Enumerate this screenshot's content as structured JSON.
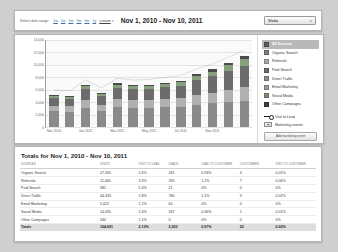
{
  "header": {
    "range_label": "Select date range:",
    "ranges": [
      "1w",
      "2w",
      "1m",
      "3m",
      "6m",
      "1y",
      "custom"
    ],
    "custom_caret": "▾",
    "date_title": "Nov 1, 2010 - Nov 10, 2011",
    "metric_selected": "Visits",
    "metric_caret": "▾"
  },
  "legend": {
    "items": [
      {
        "label": "All Sources",
        "color": "#5b5b5b",
        "selected": true
      },
      {
        "label": "Organic Search",
        "color": "#7d7d7d",
        "selected": false
      },
      {
        "label": "Referrals",
        "color": "#a8a8a8",
        "selected": false
      },
      {
        "label": "Paid Search",
        "color": "#6e6e6e",
        "selected": false
      },
      {
        "label": "Direct Traffic",
        "color": "#8d8d8d",
        "selected": false
      },
      {
        "label": "Email Marketing",
        "color": "#9a9a9a",
        "selected": false
      },
      {
        "label": "Social Media",
        "color": "#7a8f72",
        "selected": false
      },
      {
        "label": "Other Campaigns",
        "color": "#3f3f3f",
        "selected": false
      }
    ],
    "visit_to_lead": "Visit to Lead",
    "marketing_events": "Marketing events",
    "add_button": "Add marketing event"
  },
  "chart_data": {
    "type": "bar",
    "stacked": true,
    "title": "",
    "xlabel": "",
    "ylabel": "",
    "ylim": [
      0,
      14000
    ],
    "yticks": [
      "0",
      "2,000",
      "4,000",
      "6,000",
      "8,000",
      "10,000",
      "12,000",
      "14,000"
    ],
    "ytick_values": [
      0,
      2000,
      4000,
      6000,
      8000,
      10000,
      12000,
      14000
    ],
    "grid": true,
    "legend_position": "right",
    "categories": [
      "Nov 2010",
      "Dec 2010",
      "Jan 2011",
      "Feb 2011",
      "Mar 2011",
      "Apr 2011",
      "May 2011",
      "Jun 2011",
      "Jul 2011",
      "Aug 2011",
      "Sep 2011",
      "Oct 2011",
      "Nov 2011"
    ],
    "tick_labels": [
      "Nov 2010",
      "Jan 2011",
      "Mar 2011",
      "May 2011",
      "Jul 2011",
      "Sep 2011"
    ],
    "tick_index": [
      0,
      2,
      4,
      6,
      8,
      10
    ],
    "series": [
      {
        "name": "Organic Search",
        "color": "#8a8a8a",
        "values": [
          2500,
          2450,
          3050,
          2600,
          3150,
          3100,
          3050,
          3150,
          3250,
          3550,
          3800,
          4050,
          4250
        ]
      },
      {
        "name": "Referrals",
        "color": "#b0b0b0",
        "values": [
          950,
          900,
          1250,
          1000,
          1300,
          1250,
          1300,
          1350,
          1400,
          1650,
          1750,
          1950,
          2150
        ]
      },
      {
        "name": "Direct Traffic",
        "color": "#6c6c6c",
        "values": [
          1250,
          1200,
          1800,
          1350,
          1900,
          1750,
          1800,
          1900,
          2000,
          2350,
          2600,
          3000,
          3450
        ]
      },
      {
        "name": "Social Media",
        "color": "#86a07c",
        "values": [
          300,
          320,
          420,
          360,
          450,
          430,
          460,
          500,
          540,
          640,
          760,
          900,
          1050
        ]
      },
      {
        "name": "Other Campaigns",
        "color": "#4a4a4a",
        "values": [
          120,
          130,
          190,
          150,
          200,
          190,
          210,
          230,
          250,
          310,
          380,
          470,
          600
        ]
      }
    ],
    "totals": [
      5120,
      5000,
      6710,
      5460,
      7000,
      6720,
      6820,
      7130,
      7440,
      8500,
      9290,
      10370,
      11500
    ],
    "trend_line": {
      "name": "Visit to Lead",
      "color": "#1b1b1b"
    }
  },
  "totals": {
    "title": "Totals for Nov 1, 2010 - Nov 10, 2011",
    "columns": [
      "Sources",
      "Visits",
      "Visit to Lead",
      "Leads",
      "Lead to Customer",
      "Customers",
      "Visit to Customer"
    ],
    "rows": [
      {
        "source": "Organic Search",
        "visits": "27,565",
        "visit_to_lead": "1.6%",
        "leads": "431",
        "lead_to_customer": "0.93%",
        "customers": "4",
        "visit_to_customer": "0.01%"
      },
      {
        "source": "Referrals",
        "visits": "11,460",
        "visit_to_lead": "3.3%",
        "leads": "335",
        "lead_to_customer": "1.2%",
        "customers": "7",
        "visit_to_customer": "0.06%"
      },
      {
        "source": "Paid Search",
        "visits": "382",
        "visit_to_lead": "5.4%",
        "leads": "21",
        "lead_to_customer": "0%",
        "customers": "0",
        "visit_to_customer": "0%"
      },
      {
        "source": "Direct Traffic",
        "visits": "44,333",
        "visit_to_lead": "1.8%",
        "leads": "780",
        "lead_to_customer": "1.1%",
        "customers": "9",
        "visit_to_customer": "0.02%"
      },
      {
        "source": "Email Marketing",
        "visits": "5,022",
        "visit_to_lead": "1.2%",
        "leads": "64",
        "lead_to_customer": "0%",
        "customers": "0",
        "visit_to_customer": "0%"
      },
      {
        "source": "Social Media",
        "visits": "14,635",
        "visit_to_lead": "2.4%",
        "leads": "347",
        "lead_to_customer": "0.36%",
        "customers": "1",
        "visit_to_customer": "0.01%"
      },
      {
        "source": "Other Campaigns",
        "visits": "340",
        "visit_to_lead": "1.1%",
        "leads": "0",
        "lead_to_customer": "0%",
        "customers": "0",
        "visit_to_customer": "0%"
      },
      {
        "source": "Totals",
        "visits": "104,691",
        "visit_to_lead": "2.13%",
        "leads": "2,203",
        "lead_to_customer": "0.97%",
        "customers": "22",
        "visit_to_customer": "0.02%",
        "is_total": true
      }
    ]
  }
}
